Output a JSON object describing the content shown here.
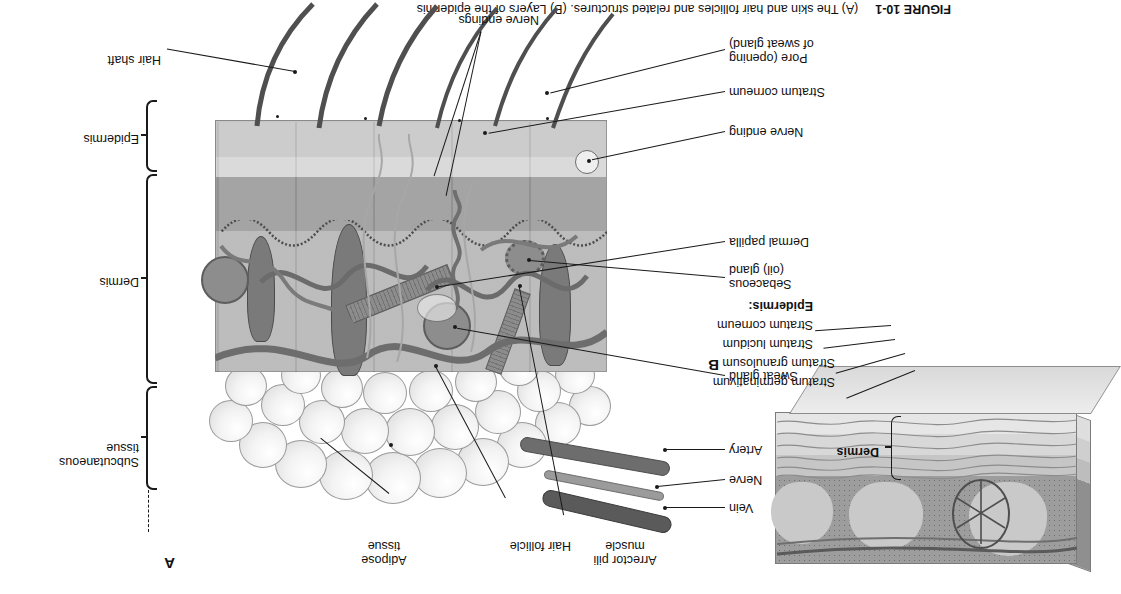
{
  "figure": {
    "caption_prefix": "FIGURE 10-1",
    "caption_text": "(A) The skin and hair follicles and related structures. (B) Layers of the epidermis",
    "panel_a_letter": "A",
    "panel_b_letter": "B"
  },
  "panel_a": {
    "labels_top_right": [
      {
        "id": "adipose-tissue",
        "text": "Adipose\ntissue",
        "line1": "Adipose",
        "line2": "tissue"
      },
      {
        "id": "hair-follicle",
        "text": "Hair follicle",
        "line1": "Hair follicle",
        "line2": ""
      },
      {
        "id": "arrector-pili-muscle",
        "text": "Arrector pili\nmuscle",
        "line1": "Arrector pili",
        "line2": "muscle"
      }
    ],
    "labels_left": [
      {
        "id": "vein",
        "line1": "Vein",
        "line2": ""
      },
      {
        "id": "nerve",
        "line1": "Nerve",
        "line2": ""
      },
      {
        "id": "artery",
        "line1": "Artery",
        "line2": ""
      },
      {
        "id": "sweat-gland",
        "line1": "Sweat gland",
        "line2": ""
      },
      {
        "id": "sebaceous-oil-gland",
        "line1": "Sebaceous",
        "line2": "(oil) gland"
      },
      {
        "id": "dermal-papilla",
        "line1": "Dermal papilla",
        "line2": ""
      },
      {
        "id": "nerve-ending",
        "line1": "Nerve ending",
        "line2": ""
      },
      {
        "id": "stratum-corneum",
        "line1": "Stratum corneum",
        "line2": ""
      },
      {
        "id": "pore-opening-of-sweat-gland",
        "line1": "Pore (opening",
        "line2": "of sweat gland)"
      }
    ],
    "labels_bottom": [
      {
        "id": "nerve-endings",
        "line1": "Nerve endings",
        "line2": ""
      },
      {
        "id": "hair-shaft",
        "line1": "Hair shaft",
        "line2": ""
      }
    ],
    "brackets": [
      {
        "id": "subcutaneous-tissue",
        "line1": "Subcutaneous",
        "line2": "tissue"
      },
      {
        "id": "dermis",
        "line1": "Dermis",
        "line2": ""
      },
      {
        "id": "epidermis",
        "line1": "Epidermis",
        "line2": ""
      }
    ]
  },
  "panel_b": {
    "bracket_label": "Dermis",
    "group_heading": "Epidermis:",
    "layers": [
      {
        "id": "stratum-corneum",
        "text": "Stratum corneum"
      },
      {
        "id": "stratum-lucidum",
        "text": "Stratum lucidum"
      },
      {
        "id": "stratum-granulosum",
        "text": "Stratum granulosum"
      },
      {
        "id": "stratum-germinativum",
        "text": "Stratum germinativum"
      }
    ]
  },
  "colors": {
    "ink": "#111111",
    "page_background": "#ffffff",
    "epidermis_fill": "#8e8e8e",
    "dermis_fill": "#b9b9b9",
    "subcutaneous_fill": "#f1f1f1",
    "vessel_fill": "#6d6d6d"
  }
}
